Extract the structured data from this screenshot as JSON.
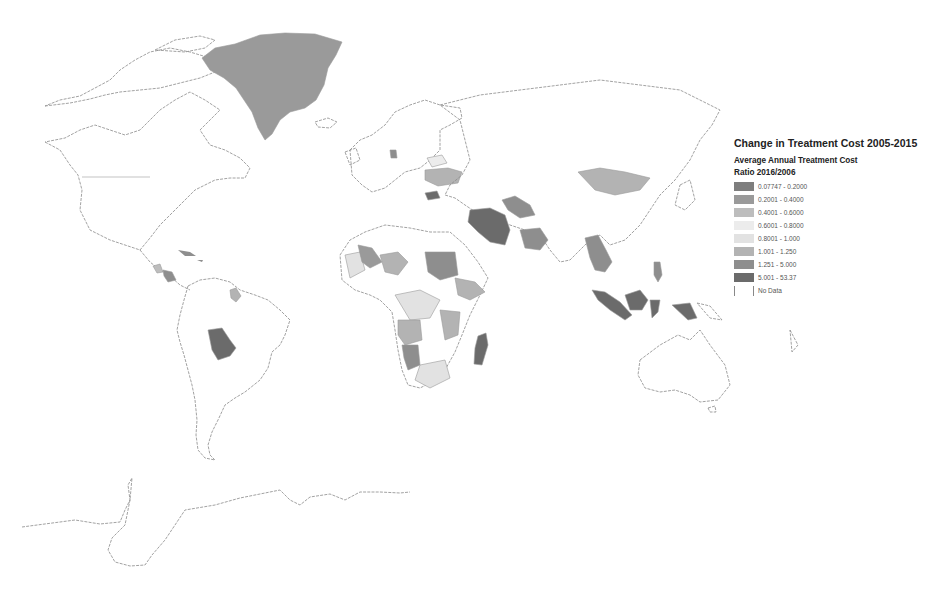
{
  "legend": {
    "title": "Change in Treatment Cost 2005-2015",
    "subtitle": "Average Annual Treatment Cost",
    "ratio_label": "Ratio 2016/2006",
    "classes": [
      {
        "label": "0.07747 - 0.2000",
        "color": "#7e7e7e"
      },
      {
        "label": "0.2001 - 0.4000",
        "color": "#9a9a9a"
      },
      {
        "label": "0.4001 - 0.6000",
        "color": "#bdbdbd"
      },
      {
        "label": "0.6001 - 0.8000",
        "color": "#ececec"
      },
      {
        "label": "0.8001 - 1.000",
        "color": "#e2e2e2"
      },
      {
        "label": "1.001 - 1.250",
        "color": "#b3b3b3"
      },
      {
        "label": "1.251 - 5.000",
        "color": "#8e8e8e"
      },
      {
        "label": "5.001 - 53.37",
        "color": "#6b6b6b"
      },
      {
        "label": "No Data",
        "color": "#ffffff"
      }
    ]
  },
  "map": {
    "type": "choropleth-world",
    "shaded_regions": [
      {
        "region": "Greenland",
        "class": "0.2001 - 0.4000"
      },
      {
        "region": "Denmark",
        "class": "1.251 - 5.000"
      },
      {
        "region": "Belarus",
        "class": "0.6001 - 0.8000"
      },
      {
        "region": "Ukraine",
        "class": "1.001 - 1.250"
      },
      {
        "region": "Bulgaria",
        "class": "5.001 - 53.37"
      },
      {
        "region": "Iran",
        "class": "5.001 - 53.37"
      },
      {
        "region": "Turkmenistan/Uzbekistan",
        "class": "1.251 - 5.000"
      },
      {
        "region": "Pakistan",
        "class": "1.251 - 5.000"
      },
      {
        "region": "Mongolia",
        "class": "1.001 - 1.250"
      },
      {
        "region": "Myanmar/Thailand/Cambodia",
        "class": "1.251 - 5.000"
      },
      {
        "region": "Indonesia",
        "class": "5.001 - 53.37"
      },
      {
        "region": "Papua New Guinea",
        "class": "5.001 - 53.37"
      },
      {
        "region": "Philippines",
        "class": "1.251 - 5.000"
      },
      {
        "region": "Bolivia",
        "class": "5.001 - 53.37"
      },
      {
        "region": "Nicaragua",
        "class": "1.251 - 5.000"
      },
      {
        "region": "Guyana",
        "class": "1.001 - 1.250"
      },
      {
        "region": "Madagascar",
        "class": "5.001 - 53.37"
      },
      {
        "region": "Sudan",
        "class": "1.251 - 5.000"
      },
      {
        "region": "Namibia",
        "class": "1.251 - 5.000"
      },
      {
        "region": "Angola",
        "class": "1.001 - 1.250"
      }
    ]
  }
}
